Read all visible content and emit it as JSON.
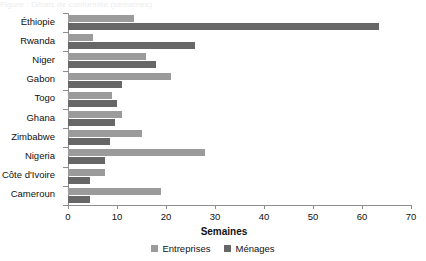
{
  "title_remnant": "Figure : Délais de conformité (semaines)",
  "chart_data": {
    "type": "bar",
    "orientation": "horizontal",
    "title": "",
    "xlabel": "Semaines",
    "ylabel": "",
    "xlim": [
      0,
      70
    ],
    "xticks": [
      0,
      10,
      20,
      30,
      40,
      50,
      60,
      70
    ],
    "grid": false,
    "legend_position": "bottom-center",
    "categories": [
      "Éthiopie",
      "Rwanda",
      "Niger",
      "Gabon",
      "Togo",
      "Ghana",
      "Zimbabwe",
      "Nigeria",
      "Côte d'Ivoire",
      "Cameroun"
    ],
    "series": [
      {
        "name": "Entreprises",
        "color": "#9b9b9b",
        "values": [
          13.5,
          5.0,
          16.0,
          21.0,
          9.0,
          11.0,
          15.0,
          28.0,
          7.5,
          19.0
        ]
      },
      {
        "name": "Ménages",
        "color": "#676767",
        "values": [
          63.5,
          26.0,
          18.0,
          11.0,
          10.0,
          9.5,
          8.5,
          7.5,
          4.5,
          4.5
        ]
      }
    ]
  },
  "legend": {
    "items": [
      {
        "label": "Entreprises",
        "swatch": "legend-swatch-entreprises"
      },
      {
        "label": "Ménages",
        "swatch": "legend-swatch-menages"
      }
    ]
  },
  "axis": {
    "x_title": "Semaines",
    "tick_labels": [
      "0",
      "10",
      "20",
      "30",
      "40",
      "50",
      "60",
      "70"
    ]
  }
}
